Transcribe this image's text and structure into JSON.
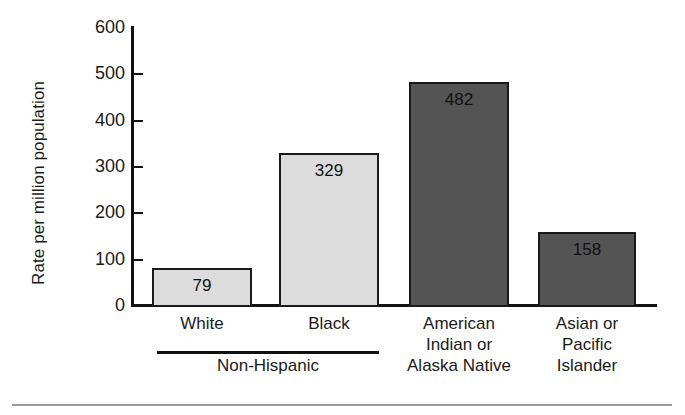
{
  "chart_data": {
    "type": "bar",
    "title": "",
    "xlabel": "",
    "ylabel": "Rate per million population",
    "ylim": [
      0,
      600
    ],
    "yticks": [
      600,
      500,
      400,
      300,
      200,
      100,
      0
    ],
    "grid": false,
    "legend": null,
    "categories": [
      "White",
      "Black",
      "American Indian or Alaska Native",
      "Asian or Pacific Islander"
    ],
    "category_lines": [
      [
        "White"
      ],
      [
        "Black"
      ],
      [
        "American",
        "Indian or",
        "Alaska Native"
      ],
      [
        "Asian or",
        "Pacific",
        "Islander"
      ]
    ],
    "values": [
      79,
      329,
      482,
      158
    ],
    "value_labels": [
      "79",
      "329",
      "482",
      "158"
    ],
    "bar_colors": [
      "#dcdcdc",
      "#dcdcdc",
      "#545454",
      "#545454"
    ],
    "bar_edge_color": "#1a1a1a",
    "group_bracket": {
      "label": "Non-Hispanic",
      "members": [
        "White",
        "Black"
      ]
    }
  }
}
